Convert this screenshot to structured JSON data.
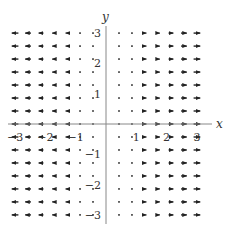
{
  "chart_data": {
    "type": "vector_field",
    "title": "",
    "xlabel": "x",
    "ylabel": "y",
    "field": "F(x, y) = (x, 0)",
    "xlim": [
      -3.3,
      3.3
    ],
    "ylim": [
      -3.3,
      3.3
    ],
    "x_ticks": [
      -3,
      -2,
      -1,
      1,
      2,
      3
    ],
    "y_ticks": [
      -3,
      -2,
      -1,
      1,
      2,
      3
    ],
    "x_tick_labels": [
      "−3",
      "−2",
      "−1",
      "1",
      "2",
      "3"
    ],
    "y_tick_labels": [
      "−3",
      "−2",
      "−1",
      "1",
      "2",
      "3"
    ],
    "grid_x": [
      -3,
      -2.571,
      -2.143,
      -1.714,
      -1.286,
      -0.857,
      -0.429,
      0.429,
      0.857,
      1.286,
      1.714,
      2.143,
      2.571,
      3
    ],
    "grid_y": [
      -3,
      -2.571,
      -2.143,
      -1.714,
      -1.286,
      -0.857,
      -0.429,
      0,
      0.429,
      0.857,
      1.286,
      1.714,
      2.143,
      2.571,
      3
    ],
    "arrow_color": "#222222",
    "axis_color": "#888888",
    "grid": false,
    "legend": null
  },
  "axes": {
    "x_label": "x",
    "y_label": "y"
  }
}
